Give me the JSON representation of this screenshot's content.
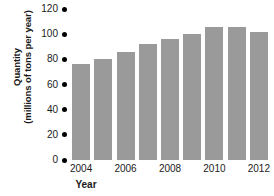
{
  "chart_data": {
    "type": "bar",
    "title": "",
    "xlabel": "Year",
    "ylabel": "Quantity (millions of tons per year)",
    "ylabel_line1": "Quantity",
    "ylabel_line2": "(millions of tons per year)",
    "categories": [
      2004,
      2005,
      2006,
      2007,
      2008,
      2009,
      2010,
      2011,
      2012
    ],
    "values": [
      76,
      80,
      86,
      92,
      96,
      100,
      106,
      106,
      102
    ],
    "ylim": [
      0,
      120
    ],
    "ytick_labels": [
      "120",
      "100",
      "80",
      "60",
      "40",
      "20",
      "0"
    ],
    "ytick_values": [
      120,
      100,
      80,
      60,
      40,
      20,
      0
    ],
    "xtick_labels": [
      "2004",
      "2006",
      "2008",
      "2010",
      "2012"
    ],
    "xtick_values": [
      2004,
      2006,
      2008,
      2010,
      2012
    ],
    "grid": false,
    "legend": null,
    "bar_color": "#9a9a9a",
    "tick_marker_color": "#000000"
  }
}
